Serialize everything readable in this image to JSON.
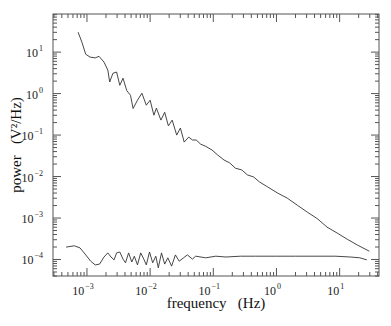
{
  "chart_data": {
    "type": "line",
    "title": "",
    "xlabel": "frequency   (Hz)",
    "ylabel": "power   (V²/Hz)",
    "xscale": "log",
    "yscale": "log",
    "xlim": [
      0.00029,
      42
    ],
    "ylim": [
      4e-05,
      83
    ],
    "grid": false,
    "legend": null,
    "x_ticks": [
      {
        "exp": -3,
        "label": "10",
        "sup": "−3"
      },
      {
        "exp": -2,
        "label": "10",
        "sup": "−2"
      },
      {
        "exp": -1,
        "label": "10",
        "sup": "−1"
      },
      {
        "exp": 0,
        "label": "10",
        "sup": "0"
      },
      {
        "exp": 1,
        "label": "10",
        "sup": "1"
      }
    ],
    "y_ticks": [
      {
        "exp": 1,
        "label": "10",
        "sup": "1"
      },
      {
        "exp": 0,
        "label": "10",
        "sup": "0"
      },
      {
        "exp": -1,
        "label": "10",
        "sup": "−1"
      },
      {
        "exp": -2,
        "label": "10",
        "sup": "−2"
      },
      {
        "exp": -3,
        "label": "10",
        "sup": "−3"
      },
      {
        "exp": -4,
        "label": "10",
        "sup": "−4"
      }
    ],
    "series": [
      {
        "name": "upper spectrum (1/f²-like)",
        "color": "#333333",
        "log10_x": [
          -3.14,
          -3.08,
          -3.02,
          -2.95,
          -2.87,
          -2.81,
          -2.73,
          -2.67,
          -2.64,
          -2.59,
          -2.53,
          -2.48,
          -2.43,
          -2.37,
          -2.31,
          -2.27,
          -2.2,
          -2.13,
          -2.06,
          -2.0,
          -1.94,
          -1.9,
          -1.83,
          -1.77,
          -1.71,
          -1.65,
          -1.58,
          -1.52,
          -1.46,
          -1.39,
          -1.33,
          -1.27,
          -1.2,
          -1.12,
          -1.02,
          -0.93,
          -0.83,
          -0.74,
          -0.65,
          -0.55,
          -0.46,
          -0.36,
          -0.27,
          -0.14,
          0.02,
          0.17,
          0.33,
          0.49,
          0.65,
          0.8,
          0.96,
          1.12,
          1.28,
          1.47
        ],
        "log10_y": [
          1.48,
          1.24,
          0.95,
          0.88,
          0.86,
          0.9,
          0.76,
          0.57,
          0.28,
          0.49,
          0.52,
          0.2,
          0.37,
          0.07,
          -0.04,
          -0.36,
          -0.16,
          0.01,
          -0.28,
          -0.16,
          -0.52,
          -0.35,
          -0.64,
          -0.45,
          -0.78,
          -0.64,
          -1.0,
          -0.83,
          -1.17,
          -1.05,
          -1.12,
          -1.12,
          -1.22,
          -1.27,
          -1.36,
          -1.48,
          -1.6,
          -1.67,
          -1.8,
          -1.84,
          -1.96,
          -2.01,
          -2.13,
          -2.25,
          -2.4,
          -2.52,
          -2.69,
          -2.86,
          -3.02,
          -3.22,
          -3.36,
          -3.51,
          -3.65,
          -3.8
        ]
      },
      {
        "name": "lower spectrum (flat noise floor)",
        "color": "#333333",
        "log10_x": [
          -3.33,
          -3.2,
          -3.11,
          -3.03,
          -2.94,
          -2.87,
          -2.8,
          -2.73,
          -2.67,
          -2.62,
          -2.57,
          -2.53,
          -2.48,
          -2.43,
          -2.39,
          -2.34,
          -2.29,
          -2.25,
          -2.2,
          -2.15,
          -2.1,
          -2.06,
          -2.01,
          -1.96,
          -1.91,
          -1.87,
          -1.82,
          -1.77,
          -1.72,
          -1.66,
          -1.6,
          -1.54,
          -1.47,
          -1.41,
          -1.33,
          -1.28,
          -1.12,
          -0.96,
          -0.8,
          -0.57,
          -0.33,
          -0.02,
          0.3,
          0.61,
          0.93,
          1.17,
          1.32,
          1.43
        ],
        "log10_y": [
          -3.7,
          -3.67,
          -3.72,
          -3.87,
          -4.04,
          -4.13,
          -4.11,
          -3.94,
          -3.84,
          -3.94,
          -4.01,
          -3.84,
          -3.82,
          -3.99,
          -4.08,
          -3.84,
          -4.06,
          -3.92,
          -4.13,
          -3.84,
          -3.99,
          -4.13,
          -3.82,
          -4.08,
          -3.92,
          -4.2,
          -3.84,
          -4.11,
          -3.96,
          -4.16,
          -3.89,
          -4.04,
          -3.96,
          -3.89,
          -3.99,
          -3.92,
          -3.96,
          -3.92,
          -3.94,
          -3.92,
          -3.92,
          -3.92,
          -3.92,
          -3.92,
          -3.92,
          -3.94,
          -3.96,
          -4.01
        ]
      }
    ]
  }
}
